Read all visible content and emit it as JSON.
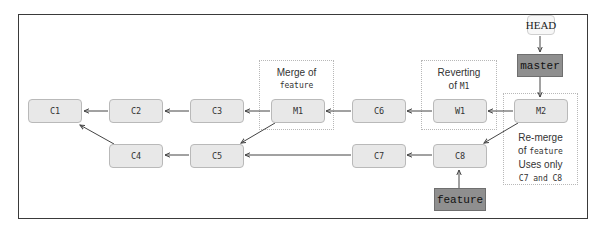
{
  "diagram": {
    "type": "git-commit-graph",
    "commits": [
      {
        "id": "C1",
        "label": "C1",
        "row": 1
      },
      {
        "id": "C2",
        "label": "C2",
        "row": 1
      },
      {
        "id": "C3",
        "label": "C3",
        "row": 1
      },
      {
        "id": "M1",
        "label": "M1",
        "row": 1
      },
      {
        "id": "C6",
        "label": "C6",
        "row": 1
      },
      {
        "id": "W1",
        "label": "W1",
        "row": 1
      },
      {
        "id": "M2",
        "label": "M2",
        "row": 1
      },
      {
        "id": "C4",
        "label": "C4",
        "row": 2
      },
      {
        "id": "C5",
        "label": "C5",
        "row": 2
      },
      {
        "id": "C7",
        "label": "C7",
        "row": 2
      },
      {
        "id": "C8",
        "label": "C8",
        "row": 2
      }
    ],
    "edges": [
      [
        "C2",
        "C1"
      ],
      [
        "C3",
        "C2"
      ],
      [
        "M1",
        "C3"
      ],
      [
        "C6",
        "M1"
      ],
      [
        "W1",
        "C6"
      ],
      [
        "M2",
        "W1"
      ],
      [
        "C4",
        "C1"
      ],
      [
        "C5",
        "C4"
      ],
      [
        "M1",
        "C5"
      ],
      [
        "C7",
        "C5"
      ],
      [
        "C8",
        "C7"
      ],
      [
        "M2",
        "C8"
      ],
      [
        "HEAD",
        "master"
      ],
      [
        "master",
        "M2"
      ],
      [
        "feature",
        "C8"
      ]
    ],
    "refs": {
      "head": "HEAD",
      "master": "master",
      "feature": "feature"
    },
    "annotations": {
      "merge": {
        "line1": "Merge of",
        "line2": "feature"
      },
      "revert": {
        "line1": "Reverting",
        "line2_prefix": "of ",
        "line2_code": "M1"
      },
      "remerge": {
        "line1": "Re-merge",
        "line2_prefix": "of ",
        "line2_code": "feature",
        "line3": "Uses only",
        "line4_a": "C7",
        "line4_mid": " and ",
        "line4_b": "C8"
      }
    },
    "colors": {
      "node_fill": "#e8e8e8",
      "node_border": "#b9b9b9",
      "branch_fill": "#8f8f8f",
      "arrow": "#444444"
    }
  }
}
